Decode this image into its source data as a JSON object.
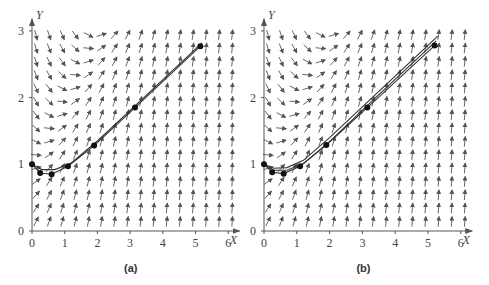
{
  "panels": [
    {
      "id": "a",
      "caption": "(a)",
      "origin_px": [
        32,
        231
      ],
      "scale_px": [
        32.7,
        66.7
      ],
      "x_axis_label": "X",
      "y_axis_label": "Y",
      "x_ticks": [
        "0",
        "1",
        "2",
        "3",
        "4",
        "5",
        "6"
      ],
      "y_ticks": [
        "0",
        "1",
        "2",
        "3"
      ],
      "points": [
        [
          0,
          1
        ],
        [
          0.25,
          0.87
        ],
        [
          0.6,
          0.85
        ],
        [
          1.1,
          0.97
        ],
        [
          1.9,
          1.28
        ],
        [
          3.15,
          1.85
        ],
        [
          5.15,
          2.77
        ]
      ],
      "curves": [
        [
          [
            0,
            1
          ],
          [
            0.25,
            0.87
          ],
          [
            0.6,
            0.85
          ],
          [
            1.1,
            0.97
          ],
          [
            1.9,
            1.28
          ],
          [
            3.15,
            1.85
          ],
          [
            5.15,
            2.77
          ]
        ],
        [
          [
            0,
            1
          ],
          [
            0.3,
            0.92
          ],
          [
            0.7,
            0.92
          ],
          [
            1.2,
            1.02
          ],
          [
            2.0,
            1.35
          ],
          [
            3.2,
            1.9
          ],
          [
            5.2,
            2.82
          ]
        ]
      ]
    },
    {
      "id": "b",
      "caption": "(b)",
      "origin_px": [
        264,
        231
      ],
      "scale_px": [
        32.8,
        66.7
      ],
      "x_axis_label": "X",
      "y_axis_label": "Y",
      "x_ticks": [
        "0",
        "1",
        "2",
        "3",
        "4",
        "5",
        "6"
      ],
      "y_ticks": [
        "0",
        "1",
        "2",
        "3"
      ],
      "points": [
        [
          0,
          1
        ],
        [
          0.25,
          0.88
        ],
        [
          0.6,
          0.86
        ],
        [
          1.1,
          0.97
        ],
        [
          1.9,
          1.29
        ],
        [
          3.15,
          1.85
        ],
        [
          5.2,
          2.78
        ]
      ],
      "curves": [
        [
          [
            0,
            1
          ],
          [
            0.25,
            0.88
          ],
          [
            0.6,
            0.86
          ],
          [
            1.1,
            0.97
          ],
          [
            1.9,
            1.29
          ],
          [
            3.15,
            1.85
          ],
          [
            5.2,
            2.78
          ]
        ],
        [
          [
            0,
            1
          ],
          [
            0.3,
            0.94
          ],
          [
            0.7,
            0.95
          ],
          [
            1.2,
            1.06
          ],
          [
            2.0,
            1.4
          ],
          [
            3.3,
            2.0
          ],
          [
            5.3,
            2.92
          ]
        ],
        [
          [
            0,
            1
          ],
          [
            0.3,
            0.91
          ],
          [
            0.7,
            0.91
          ],
          [
            1.2,
            1.01
          ],
          [
            2.0,
            1.34
          ],
          [
            3.25,
            1.93
          ],
          [
            5.25,
            2.85
          ]
        ]
      ]
    }
  ],
  "field": {
    "x_range": [
      0,
      6
    ],
    "y_range": [
      0,
      3
    ],
    "x_step": 0.4,
    "y_step": 0.2,
    "arrow_color": "#555555",
    "description": "slope field dY/dX = X - Y + 1 style direction field"
  },
  "colors": {
    "axis": "#555555",
    "curve": "#333333",
    "point": "#111111"
  }
}
